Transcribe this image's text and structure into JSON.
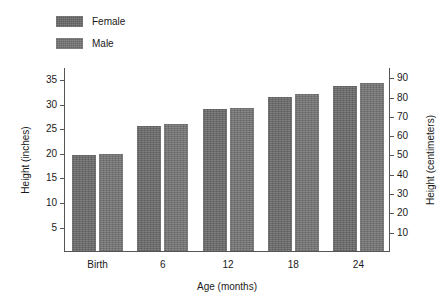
{
  "legend": {
    "items": [
      {
        "label": "Female",
        "color": "#6b6b6b",
        "swatch_name": "legend-swatch-female"
      },
      {
        "label": "Male",
        "color": "#767676",
        "swatch_name": "legend-swatch-male"
      }
    ]
  },
  "axes": {
    "x_title": "Age (months)",
    "y_left_title": "Height (inches)",
    "y_right_title": "Height (centimeters)",
    "y_left_ticks": [
      "5",
      "10",
      "15",
      "20",
      "25",
      "30",
      "35"
    ],
    "y_right_ticks": [
      "10",
      "20",
      "30",
      "40",
      "50",
      "60",
      "70",
      "80",
      "90"
    ],
    "x_ticks": [
      "Birth",
      "6",
      "12",
      "18",
      "24"
    ]
  },
  "chart_data": {
    "type": "bar",
    "title": "",
    "xlabel": "Age (months)",
    "ylabel": "Height (inches)",
    "ylabel_secondary": "Height (centimeters)",
    "categories": [
      "Birth",
      "6",
      "12",
      "18",
      "24"
    ],
    "series": [
      {
        "name": "Female",
        "color": "#6b6b6b",
        "values": [
          19.6,
          25.5,
          29.0,
          31.4,
          33.6
        ]
      },
      {
        "name": "Male",
        "color": "#767676",
        "values": [
          19.8,
          25.8,
          29.2,
          32.0,
          34.2
        ]
      }
    ],
    "series_secondary_units": [
      {
        "name": "Female",
        "values": [
          49.8,
          64.8,
          73.7,
          79.8,
          85.3
        ]
      },
      {
        "name": "Male",
        "values": [
          50.3,
          65.5,
          74.2,
          81.3,
          86.9
        ]
      }
    ],
    "ylim": [
      0,
      37.5
    ],
    "ylim_secondary": [
      0,
      95.25
    ],
    "y_ticks": [
      5,
      10,
      15,
      20,
      25,
      30,
      35
    ],
    "y_ticks_secondary": [
      10,
      20,
      30,
      40,
      50,
      60,
      70,
      80,
      90
    ],
    "grid": false,
    "legend_position": "top-left",
    "bar_group_count": 5,
    "bars_per_group": 2
  }
}
